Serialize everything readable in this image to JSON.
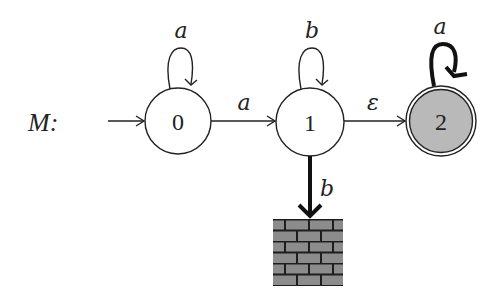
{
  "diagram": {
    "type": "finite-automaton",
    "machine_label": "M:",
    "colors": {
      "stroke": "#222222",
      "accept_fill": "#b9b9b9",
      "wall_fill": "#8c8c8c",
      "wall_mortar": "#1e1e1e"
    },
    "states": [
      {
        "id": "0",
        "label": "0",
        "start": true,
        "accepting": false
      },
      {
        "id": "1",
        "label": "1",
        "start": false,
        "accepting": false
      },
      {
        "id": "2",
        "label": "2",
        "start": false,
        "accepting": true
      }
    ],
    "transitions": [
      {
        "from": "0",
        "to": "0",
        "label": "a",
        "bold": false
      },
      {
        "from": "0",
        "to": "1",
        "label": "a",
        "bold": false
      },
      {
        "from": "1",
        "to": "1",
        "label": "b",
        "bold": false
      },
      {
        "from": "1",
        "to": "2",
        "label": "ε",
        "bold": false
      },
      {
        "from": "2",
        "to": "2",
        "label": "a",
        "bold": true
      },
      {
        "from": "1",
        "to": "dead",
        "label": "b",
        "bold": true
      }
    ],
    "dead_state": {
      "icon": "brick-wall-icon"
    }
  }
}
